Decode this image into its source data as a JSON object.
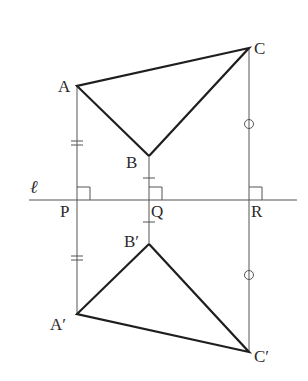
{
  "figure": {
    "line": {
      "label": "ℓ",
      "y": 200,
      "x1": 29,
      "x2": 297
    },
    "points": {
      "A": {
        "label": "A",
        "x": 77,
        "y": 86
      },
      "B": {
        "label": "B",
        "x": 149,
        "y": 156
      },
      "C": {
        "label": "C",
        "x": 249,
        "y": 48
      },
      "P": {
        "label": "P",
        "x": 77,
        "y": 200
      },
      "Q": {
        "label": "Q",
        "x": 149,
        "y": 200
      },
      "R": {
        "label": "R",
        "x": 249,
        "y": 200
      },
      "A2": {
        "label": "A′",
        "x": 77,
        "y": 314
      },
      "B2": {
        "label": "B′",
        "x": 149,
        "y": 244
      },
      "C2": {
        "label": "C′",
        "x": 249,
        "y": 352
      }
    },
    "triangles": [
      {
        "name": "ABC",
        "vertices": [
          "A",
          "B",
          "C"
        ]
      },
      {
        "name": "A'B'C'",
        "vertices": [
          "A2",
          "B2",
          "C2"
        ]
      }
    ],
    "perpendiculars": [
      {
        "from": "A",
        "to": "A2",
        "foot": "P",
        "mark": "double-tick"
      },
      {
        "from": "B",
        "to": "B2",
        "foot": "Q",
        "mark": "single-tick"
      },
      {
        "from": "C",
        "to": "C2",
        "foot": "R",
        "mark": "circle"
      }
    ],
    "equal_marks": {
      "AP": {
        "type": "double-tick",
        "y": 143
      },
      "PA2": {
        "type": "double-tick",
        "y": 258
      },
      "BQ": {
        "type": "single-tick",
        "y": 178
      },
      "QB2": {
        "type": "single-tick",
        "y": 222
      },
      "CR": {
        "type": "circle",
        "y": 124
      },
      "RC2": {
        "type": "circle",
        "y": 275
      }
    },
    "right_angle_markers": [
      "P",
      "Q",
      "R"
    ]
  }
}
